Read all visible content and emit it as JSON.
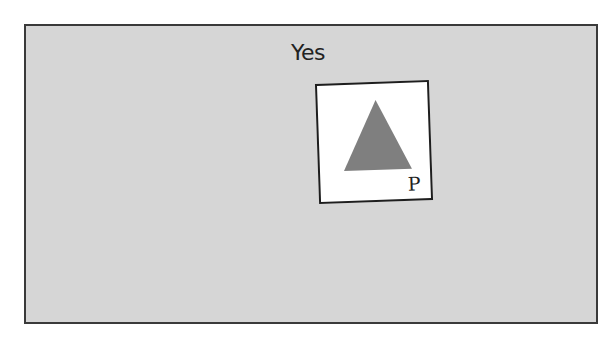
{
  "scene": {
    "label": "Yes",
    "card": {
      "shape": "triangle",
      "shape_color": "#7f7f7f",
      "corner_letter": "P"
    },
    "background_color": "#d6d6d6"
  }
}
